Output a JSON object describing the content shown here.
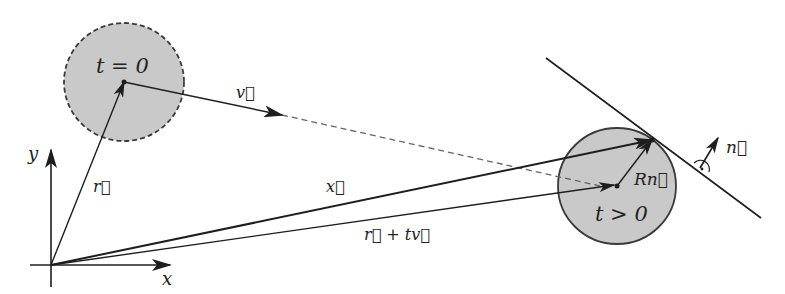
{
  "diagram": {
    "colors": {
      "ink": "#1e1e1e",
      "line": "#2a2a2a",
      "sphere_fill": "#c9c9c9",
      "sphere_stroke": "#3a3a3a",
      "dashed": "#666666",
      "background": "#ffffff"
    },
    "axes": {
      "x_label": "x",
      "y_label": "y"
    },
    "spheres": [
      {
        "id": "initial",
        "label": "t = 0",
        "outline": "dashed"
      },
      {
        "id": "later",
        "label": "t > 0",
        "outline": "solid"
      }
    ],
    "vectors": [
      {
        "id": "r",
        "label": "r⃗",
        "from": "origin",
        "to": "center at t = 0"
      },
      {
        "id": "v",
        "label": "v⃗",
        "from": "center at t = 0",
        "direction": "velocity"
      },
      {
        "id": "x",
        "label": "x⃗",
        "from": "origin",
        "to": "contact point"
      },
      {
        "id": "r_plus_tv",
        "label": "r⃗ + tv⃗",
        "from": "origin",
        "to": "center at t > 0"
      },
      {
        "id": "Rn",
        "label": "Rn⃗",
        "from": "center at t > 0",
        "to": "contact point"
      },
      {
        "id": "n",
        "label": "n⃗",
        "meaning": "plane normal"
      }
    ],
    "plane": {
      "label": "tangent plane",
      "right_angle_marker": "⊥ (dot in arc)"
    }
  }
}
